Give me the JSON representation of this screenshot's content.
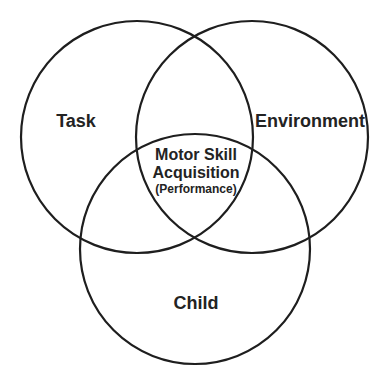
{
  "diagram": {
    "type": "venn",
    "sets": [
      {
        "id": "task",
        "label": "Task"
      },
      {
        "id": "environment",
        "label": "Environment"
      },
      {
        "id": "child",
        "label": "Child"
      }
    ],
    "intersection": {
      "sets": [
        "task",
        "environment",
        "child"
      ],
      "line1": "Motor Skill",
      "line2": "Acquisition",
      "line3": "(Performance)"
    },
    "colors": {
      "stroke": "#1e1e1e",
      "text": "#232323",
      "background": "#ffffff"
    }
  }
}
